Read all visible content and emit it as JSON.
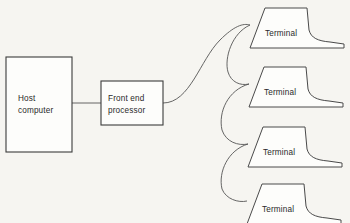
{
  "diagram": {
    "background_color": "#f6f5f1",
    "line_color": "#555555",
    "box_stroke_color": "#3b3b3b",
    "text_color": "#2a2a2a",
    "nodes": {
      "host": {
        "label_line1": "Host",
        "label_line2": "computer"
      },
      "fep": {
        "label_line1": "Front end",
        "label_line2": "processor"
      }
    },
    "terminals": [
      {
        "label": "Terminal"
      },
      {
        "label": "Terminal"
      },
      {
        "label": "Terminal"
      },
      {
        "label": "Terminal"
      }
    ]
  }
}
